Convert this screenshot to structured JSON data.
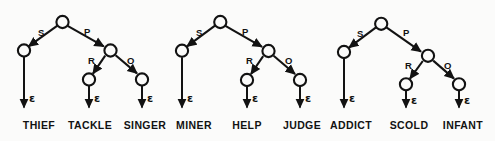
{
  "figure": {
    "background_color": "#fbfbfa",
    "ink_color": "#121212",
    "epsilon_glyph": "ε",
    "node_shape": "circle",
    "arrowhead": "filled-triangle"
  },
  "trees": [
    {
      "id": "tree-1",
      "root": {
        "label": ""
      },
      "edges": [
        {
          "label": "S",
          "from": "root",
          "to": "s-child"
        },
        {
          "label": "P",
          "from": "root",
          "to": "p-child"
        },
        {
          "label": "R",
          "from": "p-child",
          "to": "r-child"
        },
        {
          "label": "O",
          "from": "p-child",
          "to": "o-child"
        }
      ],
      "leaves": [
        {
          "epsilon": "ε",
          "word": "THIEF"
        },
        {
          "epsilon": "ε",
          "word": "TACKLE"
        },
        {
          "epsilon": "ε",
          "word": "SINGER"
        }
      ]
    },
    {
      "id": "tree-2",
      "root": {
        "label": ""
      },
      "edges": [
        {
          "label": "S",
          "from": "root",
          "to": "s-child"
        },
        {
          "label": "P",
          "from": "root",
          "to": "p-child"
        },
        {
          "label": "R",
          "from": "p-child",
          "to": "r-child"
        },
        {
          "label": "O",
          "from": "p-child",
          "to": "o-child"
        }
      ],
      "leaves": [
        {
          "epsilon": "ε",
          "word": "MINER"
        },
        {
          "epsilon": "ε",
          "word": "HELP"
        },
        {
          "epsilon": "ε",
          "word": "JUDGE"
        }
      ]
    },
    {
      "id": "tree-3",
      "root": {
        "label": ""
      },
      "edges": [
        {
          "label": "S",
          "from": "root",
          "to": "s-child"
        },
        {
          "label": "P",
          "from": "root",
          "to": "p-child"
        },
        {
          "label": "R",
          "from": "p-child",
          "to": "r-child"
        },
        {
          "label": "O",
          "from": "p-child",
          "to": "o-child"
        }
      ],
      "leaves": [
        {
          "epsilon": "ε",
          "word": "ADDICT"
        },
        {
          "epsilon": "ε",
          "word": "SCOLD"
        },
        {
          "epsilon": "ε",
          "word": "INFANT"
        }
      ]
    }
  ]
}
